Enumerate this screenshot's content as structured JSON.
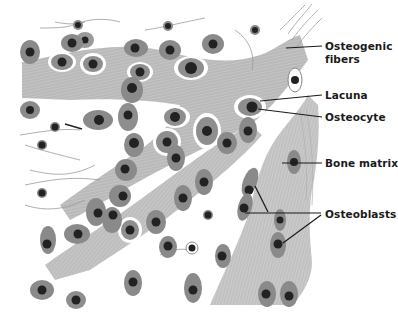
{
  "figure": {
    "type": "histology-illustration",
    "colors": {
      "background": "#ffffff",
      "matrix": "#bdbdbd",
      "matrix_stroke": "#9a9a9a",
      "cell_body": "#8c8c8c",
      "nucleus": "#222222",
      "lacuna_rim": "#ffffff",
      "label_text": "#1a1a1a",
      "leader_line": "#1a1a1a"
    }
  },
  "labels": {
    "osteogenic_fibers_1": "Osteogenic",
    "osteogenic_fibers_2": "fibers",
    "lacuna": "Lacuna",
    "osteocyte": "Osteocyte",
    "bone_matrix": "Bone matrix",
    "osteoblasts": "Osteoblasts"
  }
}
